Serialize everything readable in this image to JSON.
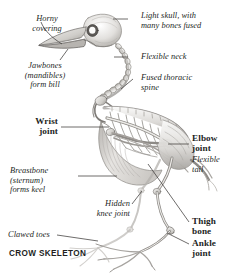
{
  "figure": {
    "caption": "CROW SKELETON",
    "colors": {
      "text": "#231f1e",
      "leader_line": "#4a4a4a",
      "bone_light": "#f2f1ef",
      "bone_mid": "#c9c7c4",
      "bone_dark": "#8d8a86",
      "background": "#ffffff"
    }
  },
  "labels": [
    {
      "id": "horny-covering",
      "text": "Horny\ncovering",
      "style": "italic",
      "align": "center"
    },
    {
      "id": "jawbones",
      "text": "Jawbones\n(mandibles)\nform bill",
      "style": "italic",
      "align": "center"
    },
    {
      "id": "light-skull",
      "text": "Light skull, with\nmany bones fused",
      "style": "italic",
      "align": "left"
    },
    {
      "id": "flexible-neck",
      "text": "Flexible neck",
      "style": "italic",
      "align": "left"
    },
    {
      "id": "fused-thoracic",
      "text": "Fused thoracic\nspine",
      "style": "italic",
      "align": "left"
    },
    {
      "id": "wrist-joint",
      "text": "Wrist\njoint",
      "style": "bold",
      "align": "right"
    },
    {
      "id": "elbow-joint",
      "text": "Elbow\njoint",
      "style": "bold",
      "align": "left"
    },
    {
      "id": "flexible-tail",
      "text": "Flexible\ntail",
      "style": "italic",
      "align": "left"
    },
    {
      "id": "breastbone",
      "text": "Breastbone\n(sternum)\nforms keel",
      "style": "italic",
      "align": "left"
    },
    {
      "id": "hidden-knee",
      "text": "Hidden\nknee joint",
      "style": "italic",
      "align": "right"
    },
    {
      "id": "thigh-bone",
      "text": "Thigh\nbone",
      "style": "bold",
      "align": "left"
    },
    {
      "id": "ankle-joint",
      "text": "Ankle\njoint",
      "style": "bold",
      "align": "left"
    },
    {
      "id": "clawed-toes",
      "text": "Clawed toes",
      "style": "italic",
      "align": "left"
    }
  ]
}
